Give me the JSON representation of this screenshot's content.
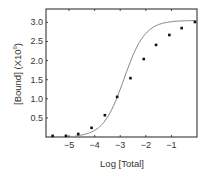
{
  "chart_data": {
    "type": "scatter",
    "title": "",
    "xlabel": "Log [Total]",
    "ylabel": "[Bound] (X10",
    "ylabel_exponent": "6",
    "ylabel_suffix": ")",
    "xlim": [
      -5.9,
      0
    ],
    "ylim": [
      0,
      3.35
    ],
    "x_ticks": [
      -5,
      -4,
      -3,
      -2,
      -1
    ],
    "x_tick_labels": [
      "−5",
      "−4",
      "−3",
      "−2",
      "−1"
    ],
    "y_ticks": [
      0.5,
      1.0,
      1.5,
      2.0,
      2.5,
      3.0
    ],
    "y_tick_labels": [
      "0.5",
      "1.0",
      "1.5",
      "2.0",
      "2.5",
      "3.0"
    ],
    "grid": false,
    "legend": null,
    "series": [
      {
        "name": "data",
        "style": "markers",
        "marker": "square",
        "x": [
          -5.64,
          -5.12,
          -4.64,
          -4.12,
          -3.6,
          -3.12,
          -2.6,
          -2.08,
          -1.6,
          -1.08,
          -0.6,
          -0.08
        ],
        "y": [
          0.03,
          0.03,
          0.08,
          0.24,
          0.57,
          1.05,
          1.54,
          2.04,
          2.41,
          2.67,
          2.85,
          3.01
        ]
      },
      {
        "name": "fit",
        "style": "line",
        "model": "sigmoid",
        "params": {
          "top": 3.05,
          "bottom": 0.0,
          "logEC50": -2.85,
          "slope": 0.85
        }
      }
    ]
  },
  "colors": {
    "axis": "#222222",
    "marker": "#111111",
    "curve": "#777777",
    "text": "#333333"
  }
}
